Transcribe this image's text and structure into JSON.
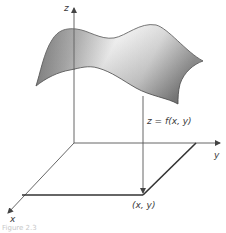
{
  "figure": {
    "axes": {
      "x_label": "x",
      "y_label": "y",
      "z_label": "z"
    },
    "surface_label": "z = f(x, y)",
    "point_label": "(x, y)",
    "caption": "Figure 2.3",
    "colors": {
      "axis": "#555555",
      "surface_dark": "#6e6e6e",
      "surface_light": "#f2f2f2",
      "surface_edge": "#5a5a5a",
      "domain_edge": "#333333"
    }
  }
}
